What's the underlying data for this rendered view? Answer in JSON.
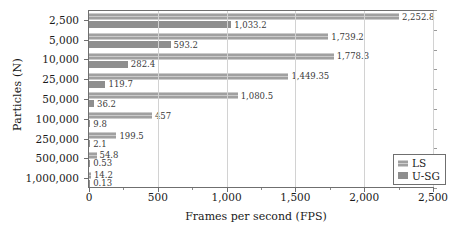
{
  "chart_data": {
    "type": "bar",
    "orientation": "horizontal",
    "title": "",
    "xlabel": "Frames per second (FPS)",
    "ylabel": "Particles (N)",
    "categories": [
      "2,500",
      "5,000",
      "10,000",
      "25,000",
      "50,000",
      "100,000",
      "250,000",
      "500,000",
      "1,000,000"
    ],
    "xlim": [
      0,
      2500
    ],
    "xticks": [
      "0",
      "500",
      "1,000",
      "1,500",
      "2,000",
      "2,500"
    ],
    "xtick_values": [
      0,
      500,
      1000,
      1500,
      2000,
      2500
    ],
    "grid": "vertical",
    "legend_position": "bottom-right",
    "series": [
      {
        "name": "LS",
        "color": "#a0a0a0",
        "values": [
          2252.8,
          1739.2,
          1778.3,
          1449.35,
          1080.5,
          457,
          199.5,
          54.8,
          14.2
        ],
        "labels": [
          "2,252.8",
          "1,739.2",
          "1,778.3",
          "1,449.35",
          "1,080.5",
          "457",
          "199.5",
          "54.8",
          "14.2"
        ]
      },
      {
        "name": "U-SG",
        "color": "#8e8e8e",
        "values": [
          1033.2,
          593.2,
          282.4,
          119.7,
          36.2,
          9.8,
          2.1,
          0.53,
          0.13
        ],
        "labels": [
          "1,033.2",
          "593.2",
          "282.4",
          "119.7",
          "36.2",
          "9.8",
          "2.1",
          "0.53",
          "0.13"
        ]
      }
    ]
  },
  "legend": {
    "items": [
      {
        "label": "LS"
      },
      {
        "label": "U-SG"
      }
    ]
  }
}
